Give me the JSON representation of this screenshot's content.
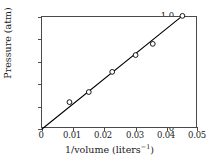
{
  "chart_data": {
    "type": "scatter",
    "title": "",
    "xlabel": "1/volume (liters⁻¹)",
    "ylabel": "Pressure (atm)",
    "xlim": [
      0,
      0.05
    ],
    "ylim": [
      0,
      1.0
    ],
    "xticks": [
      0,
      0.01,
      0.02,
      0.03,
      0.04,
      0.05
    ],
    "xtick_labels": [
      "0",
      "0.01",
      "0.02",
      "0.03",
      "0.04",
      "0.05"
    ],
    "yticks": [
      0,
      0.2,
      0.4,
      0.6,
      0.8,
      1.0
    ],
    "ytick_labels": [
      "0",
      "0.2",
      "0.4",
      "0.6",
      "0.8",
      "1.0"
    ],
    "grid": false,
    "legend": null,
    "marker": "open-circle",
    "line": "solid-black-through-origin",
    "x": [
      0.0088,
      0.015,
      0.0225,
      0.03,
      0.0355,
      0.045
    ],
    "y": [
      0.24,
      0.33,
      0.51,
      0.66,
      0.76,
      1.01
    ],
    "series": [
      {
        "name": "Pressure vs 1/volume",
        "points": [
          {
            "x": 0.0088,
            "y": 0.24
          },
          {
            "x": 0.015,
            "y": 0.33
          },
          {
            "x": 0.0225,
            "y": 0.51
          },
          {
            "x": 0.03,
            "y": 0.66
          },
          {
            "x": 0.0355,
            "y": 0.76
          },
          {
            "x": 0.045,
            "y": 1.01
          }
        ]
      }
    ],
    "fit_line": {
      "slope": 22.4,
      "intercept": 0.0,
      "from": {
        "x": 0,
        "y": 0
      },
      "to": {
        "x": 0.045,
        "y": 1.01
      }
    },
    "colors": {
      "line": "#000000",
      "marker_edge": "#000000",
      "marker_face": "#ffffff",
      "axis": "#4a4a4a",
      "background": "#ffffff"
    }
  },
  "x_axis_title_main": "1/volume (liters",
  "x_axis_title_sup": "−1",
  "x_axis_title_end": ")"
}
